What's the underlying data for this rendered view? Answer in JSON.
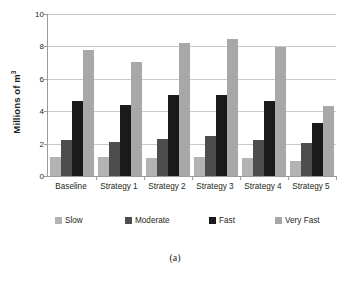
{
  "figure": {
    "caption": "(a)"
  },
  "chart_data": {
    "type": "bar",
    "title": "",
    "subtitle": "",
    "xlabel": "",
    "ylabel": "Millions of m",
    "ylabel_superscript": "3",
    "categories": [
      "Baseline",
      "Strategy 1",
      "Strategy 2",
      "Strategy 3",
      "Strategy 4",
      "Strategy 5"
    ],
    "series": [
      {
        "name": "Slow",
        "color": "#b3b3b3",
        "values": [
          1.15,
          1.2,
          1.1,
          1.2,
          1.1,
          0.95
        ]
      },
      {
        "name": "Moderate",
        "color": "#4d4d4d",
        "values": [
          2.25,
          2.1,
          2.3,
          2.45,
          2.25,
          2.05
        ]
      },
      {
        "name": "Fast",
        "color": "#1a1a1a",
        "values": [
          4.65,
          4.4,
          5.0,
          5.0,
          4.65,
          3.3
        ]
      },
      {
        "name": "Very Fast",
        "color": "#a8a8a8",
        "values": [
          7.8,
          7.05,
          8.2,
          8.45,
          7.95,
          4.3
        ]
      }
    ],
    "ylim": [
      0,
      10
    ],
    "yticks": [
      0,
      2,
      4,
      6,
      8,
      10
    ],
    "ytick_labels": [
      "0",
      "2",
      "4",
      "6",
      "8",
      "10"
    ],
    "grid": true,
    "grid_axis": "y",
    "legend_position": "bottom",
    "legend_entries": [
      "Slow",
      "Moderate",
      "Fast",
      "Very Fast"
    ],
    "colors": {
      "gridline": "#c9c9c9",
      "axis": "#9b9b9b",
      "text": "#231f20",
      "background": "#ffffff"
    }
  }
}
